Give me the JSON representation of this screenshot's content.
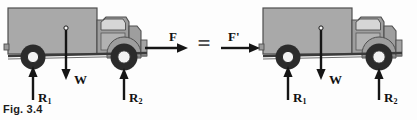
{
  "figure": {
    "caption": "Fig. 3.4",
    "equals_symbol": "="
  },
  "colors": {
    "body_fill": "#a9a9a9",
    "body_outline": "#4f4f4f",
    "cab_fill": "#9e9e9e",
    "window_fill": "#d6d6d6",
    "tire_dark": "#2b2b2b",
    "hub_light": "#f2f2f2",
    "arrow": "#151515",
    "caption_text": "#1c1c1c",
    "equals": "#4a4a4a",
    "background": "#fdfdfd"
  },
  "left_diagram": {
    "name": "truck-with-applied-force-F",
    "forces": [
      {
        "id": "F",
        "symbol": "F",
        "subscript": "",
        "direction": "right",
        "meaning": "applied driving force"
      },
      {
        "id": "W",
        "symbol": "W",
        "subscript": "",
        "direction": "down",
        "meaning": "weight at centre of gravity"
      },
      {
        "id": "R1",
        "symbol": "R",
        "subscript": "1",
        "direction": "up",
        "meaning": "rear wheel normal reaction"
      },
      {
        "id": "R2",
        "symbol": "R",
        "subscript": "2",
        "direction": "up",
        "meaning": "front wheel normal reaction"
      }
    ]
  },
  "right_diagram": {
    "name": "truck-with-applied-force-F-prime",
    "forces": [
      {
        "id": "Fp",
        "symbol": "F'",
        "subscript": "",
        "direction": "right",
        "meaning": "equivalent applied force at rear"
      },
      {
        "id": "W",
        "symbol": "W",
        "subscript": "",
        "direction": "down",
        "meaning": "weight at centre of gravity"
      },
      {
        "id": "R1",
        "symbol": "R",
        "subscript": "1",
        "direction": "up",
        "meaning": "rear wheel normal reaction"
      },
      {
        "id": "R2",
        "symbol": "R",
        "subscript": "2",
        "direction": "up",
        "meaning": "front wheel normal reaction"
      }
    ]
  }
}
